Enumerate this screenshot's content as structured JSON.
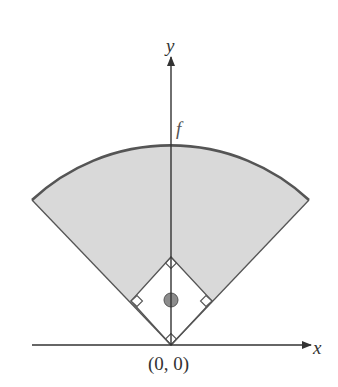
{
  "figure": {
    "labels": {
      "y_axis": "y",
      "x_axis": "x",
      "function": "f",
      "origin": "(0, 0)"
    },
    "colors": {
      "field_fill": "#d9d9d9",
      "arc_stroke": "#555555",
      "edge_stroke": "#555555",
      "axis_stroke": "#333333",
      "mound_fill": "#8c8c8c",
      "infield_fill": "#ffffff"
    },
    "elements": {
      "outfield_region": "shaded sector bounded by arc f",
      "infield_diamond": "square rotated 45° with right-angle marks at each base",
      "pitchers_mound": "small gray circle at center of diamond"
    }
  }
}
